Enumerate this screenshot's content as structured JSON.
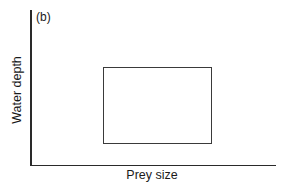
{
  "chart_data": {
    "type": "diagram",
    "panel_label": "(b)",
    "xlabel": "Prey size",
    "ylabel": "Water depth",
    "axes": {
      "x_ticks": [],
      "y_ticks": [],
      "grid": false
    },
    "shapes": [
      {
        "type": "rectangle",
        "description": "range of prey size and water depth (unlabeled region)",
        "x_range_fraction": [
          0.3,
          0.74
        ],
        "y_range_fraction": [
          0.14,
          0.63
        ]
      }
    ]
  }
}
